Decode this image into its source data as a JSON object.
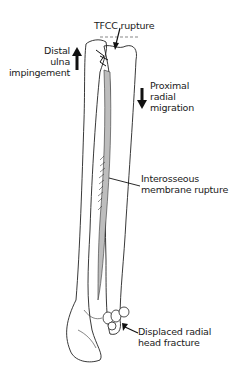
{
  "figure": {
    "labels": {
      "tfcc": "TFCC rupture",
      "distal_ulna": [
        "Distal",
        "ulna",
        "impingement"
      ],
      "proximal_radial": [
        "Proximal",
        "radial",
        "migration"
      ],
      "interosseous": [
        "Interosseous",
        "membrane rupture"
      ],
      "radial_head": [
        "Displaced radial",
        "head fracture"
      ]
    },
    "arrows": {
      "distal_ulna": "up",
      "proximal_radial": "down"
    },
    "colors": {
      "ink": "#1a1a1a",
      "background": "#ffffff"
    }
  }
}
